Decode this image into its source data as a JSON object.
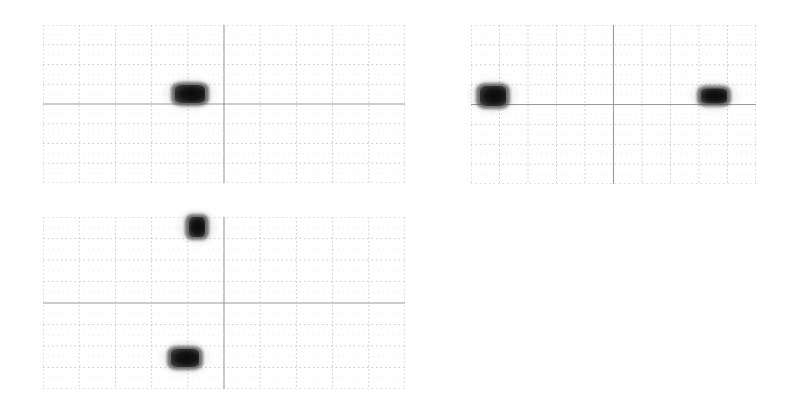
{
  "figure": {
    "background": "#ffffff",
    "grid_color_minor": "#c8c8c8",
    "grid_color_major": "#9a9a9a",
    "blob_color": "#111111",
    "grid_divisions": {
      "columns": 10,
      "rows": 8
    },
    "panels": [
      {
        "id": "panel-1",
        "x": 43,
        "y": 25,
        "width": 362,
        "height": 158,
        "blobs": [
          {
            "cx": 0.406,
            "cy": 0.437,
            "w": 30,
            "h": 18
          }
        ]
      },
      {
        "id": "panel-2",
        "x": 471,
        "y": 25,
        "width": 285,
        "height": 159,
        "blobs": [
          {
            "cx": 0.077,
            "cy": 0.447,
            "w": 26,
            "h": 20
          },
          {
            "cx": 0.853,
            "cy": 0.447,
            "w": 26,
            "h": 15
          }
        ]
      },
      {
        "id": "panel-3",
        "x": 43,
        "y": 217,
        "width": 362,
        "height": 172,
        "blobs": [
          {
            "cx": 0.425,
            "cy": 0.058,
            "w": 16,
            "h": 20
          },
          {
            "cx": 0.392,
            "cy": 0.82,
            "w": 28,
            "h": 18
          }
        ]
      }
    ]
  }
}
